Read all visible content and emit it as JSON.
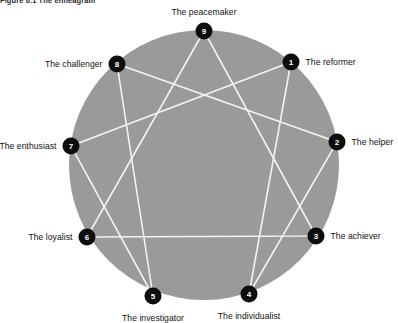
{
  "figure": {
    "title": "Figure 6.1 The enneagram",
    "circle_fill": "#9a9a9a",
    "line_color": "#f2f2f2",
    "node_fill": "#0d0d0d",
    "node_text_color": "#ffffff",
    "background": "#ffffff"
  },
  "geometry": {
    "center_x": 204,
    "center_y": 165,
    "radius": 135,
    "node_radius": 8.5
  },
  "nodes": [
    {
      "number": "1",
      "label": "The reformer",
      "angle_deg": -50,
      "x": 291,
      "y": 62,
      "label_side": "right"
    },
    {
      "number": "2",
      "label": "The helper",
      "angle_deg": -10,
      "x": 337,
      "y": 142,
      "label_side": "right"
    },
    {
      "number": "3",
      "label": "The achiever",
      "angle_deg": 30,
      "x": 316,
      "y": 236,
      "label_side": "right"
    },
    {
      "number": "4",
      "label": "The individualist",
      "angle_deg": 70,
      "x": 249,
      "y": 294,
      "label_side": "below"
    },
    {
      "number": "5",
      "label": "The investigator",
      "angle_deg": 110,
      "x": 153,
      "y": 296,
      "label_side": "below"
    },
    {
      "number": "6",
      "label": "The loyalist",
      "angle_deg": 150,
      "x": 87,
      "y": 237,
      "label_side": "left"
    },
    {
      "number": "7",
      "label": "The enthusiast",
      "angle_deg": 190,
      "x": 71,
      "y": 146,
      "label_side": "left"
    },
    {
      "number": "8",
      "label": "The challenger",
      "angle_deg": 230,
      "x": 117,
      "y": 64,
      "label_side": "left"
    },
    {
      "number": "9",
      "label": "The peacemaker",
      "angle_deg": 270,
      "x": 204,
      "y": 31,
      "label_side": "above"
    }
  ],
  "connections": {
    "triangle": [
      "9",
      "3",
      "6"
    ],
    "hexad": [
      "1",
      "4",
      "2",
      "8",
      "5",
      "7"
    ]
  }
}
